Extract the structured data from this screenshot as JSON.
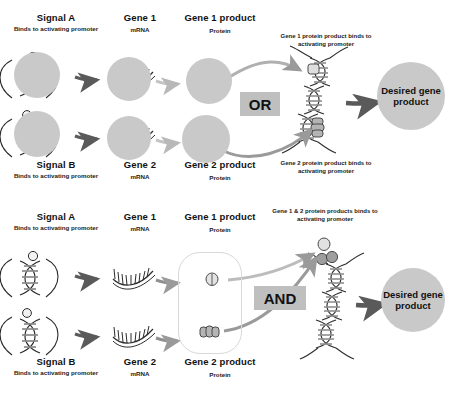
{
  "diagram": {
    "colors": {
      "circle_fill": "#c9c9c9",
      "op_box_fill": "#bfbfbf",
      "arrow_dark": "#5a5a5a",
      "arrow_light": "#b5b5b5",
      "dna_stripe": "#8e8e8e",
      "protein_light": "#dcdcdc",
      "protein_dark": "#a8a8a8",
      "text": "#111111"
    }
  },
  "panels": [
    {
      "id": "or-gate",
      "operator": "OR",
      "rows": [
        {
          "signal_title": "Signal A",
          "signal_sub": "Binds to activating promoter",
          "gene_title": "Gene 1",
          "gene_sub": "mRNA",
          "product_title": "Gene 1 product",
          "product_sub": "Protein",
          "binding_note": "Gene 1 protein product binds to activating promoter"
        },
        {
          "signal_title": "Signal B",
          "signal_sub": "Binds to activating promoter",
          "gene_title": "Gene 2",
          "gene_sub": "mRNA",
          "product_title": "Gene 2 product",
          "product_sub": "Protein",
          "binding_note": "Gene 2 protein product binds to activating promoter"
        }
      ],
      "output": "Desired gene product"
    },
    {
      "id": "and-gate",
      "operator": "AND",
      "rows": [
        {
          "signal_title": "Signal A",
          "signal_sub": "Binds to activating promoter",
          "gene_title": "Gene 1",
          "gene_sub": "mRNA",
          "product_title": "Gene 1 product",
          "product_sub": "Protein"
        },
        {
          "signal_title": "Signal B",
          "signal_sub": "Binds to activating promoter",
          "gene_title": "Gene 2",
          "gene_sub": "mRNA",
          "product_title": "Gene 2 product",
          "product_sub": "Protein"
        }
      ],
      "binding_note": "Gene 1 & 2 protein products binds to activating promoter",
      "output": "Desired gene product"
    }
  ]
}
